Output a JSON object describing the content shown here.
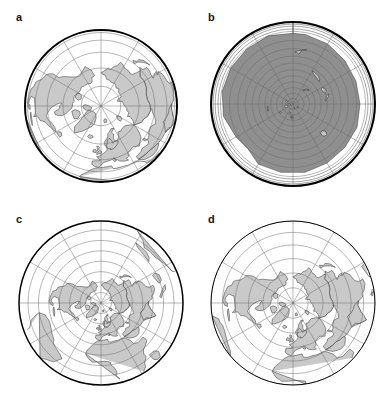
{
  "figure": {
    "type": "multi-panel-map-figure",
    "layout": "2x2 grid",
    "width": 391,
    "height": 399,
    "background": "#ffffff",
    "land_color": "#c9c9c9",
    "ocean_color": "#ffffff",
    "graticule_color": "#6d6d6d",
    "outline_color": "#000000",
    "label_color": "#141414"
  },
  "panels": [
    {
      "id": "a",
      "label": "a",
      "label_x": 16,
      "label_y": 12,
      "center_x": 101,
      "center_y": 106,
      "radius": 76,
      "rim_style": "thick",
      "coverage": "hemisphere",
      "pole_offset_y": -68,
      "parallels": [
        0,
        15,
        30,
        45,
        60,
        75
      ],
      "meridian_count": 12,
      "description": "Orthographic azimuthal projection centered on North Pole showing Europe, Africa, Greenland and Asia"
    },
    {
      "id": "b",
      "label": "b",
      "label_x": 208,
      "label_y": 12,
      "center_x": 293,
      "center_y": 104,
      "radius": 82,
      "rim_style": "thick",
      "coverage": "whole-world",
      "pole_offset_y": -24,
      "south_pole_offset_y": 62,
      "parallels": [
        0,
        15,
        30,
        45,
        60,
        75
      ],
      "meridian_count": 12,
      "description": "Whole-world azimuthal projection with compressed outer rings; Antarctica heavily distorted near South Pole"
    },
    {
      "id": "c",
      "label": "c",
      "label_x": 16,
      "label_y": 214,
      "center_x": 101,
      "center_y": 303,
      "radius": 82,
      "rim_style": "med",
      "coverage": "wider-than-hemisphere",
      "pole_offset_y": -46,
      "parallels": [
        0,
        15,
        30,
        45,
        60,
        75
      ],
      "meridian_count": 12,
      "description": "Azimuthal projection with coverage beyond a hemisphere, pole offset upward"
    },
    {
      "id": "d",
      "label": "d",
      "label_x": 208,
      "label_y": 214,
      "center_x": 293,
      "center_y": 303,
      "radius": 82,
      "rim_style": "thin",
      "coverage": "hemisphere",
      "pole_offset_y": -38,
      "parallels": [
        0,
        15,
        30,
        45,
        60,
        75
      ],
      "meridian_count": 12,
      "description": "Hemisphere azimuthal projection with thin outline and strong peripheral stretching"
    }
  ]
}
